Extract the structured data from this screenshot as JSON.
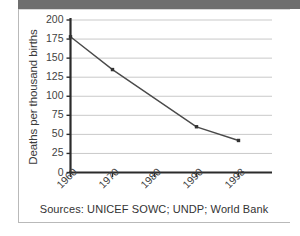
{
  "figure": {
    "caption": "Sources: UNICEF SOWC; UNDP; World Bank",
    "colors": {
      "line": "#4a4a4a",
      "marker": "#333333",
      "grid": "#c9c9c9",
      "axis": "#2b2b2b",
      "text": "#3f3f3f",
      "scan_band": "#6e6e6e",
      "frame": "#b9b9b9"
    }
  },
  "chart_data": {
    "type": "line",
    "title": "",
    "xlabel": "",
    "ylabel": "Deaths per thousand births",
    "categories": [
      "1960",
      "1970",
      "1980",
      "1990",
      "1998"
    ],
    "x": [
      1960,
      1970,
      1980,
      1990,
      1998
    ],
    "values": [
      178,
      135,
      null,
      60,
      42
    ],
    "series": [
      {
        "name": "Deaths per thousand births",
        "points": [
          {
            "x": "1960",
            "y": 178
          },
          {
            "x": "1970",
            "y": 135
          },
          {
            "x": "1990",
            "y": 60
          },
          {
            "x": "1998",
            "y": 42
          }
        ]
      }
    ],
    "ylim": [
      0,
      200
    ],
    "yticks": [
      0,
      25,
      50,
      75,
      100,
      125,
      150,
      175,
      200
    ],
    "ytick_labels": [
      "0",
      "25",
      "50",
      "75",
      "100",
      "125",
      "150",
      "175",
      "200"
    ],
    "xtick_labels": [
      "1960",
      "1970",
      "1980",
      "1990",
      "1998"
    ],
    "grid": "horizontal",
    "legend": "none",
    "markers": "square",
    "xtick_rotation": -45
  }
}
